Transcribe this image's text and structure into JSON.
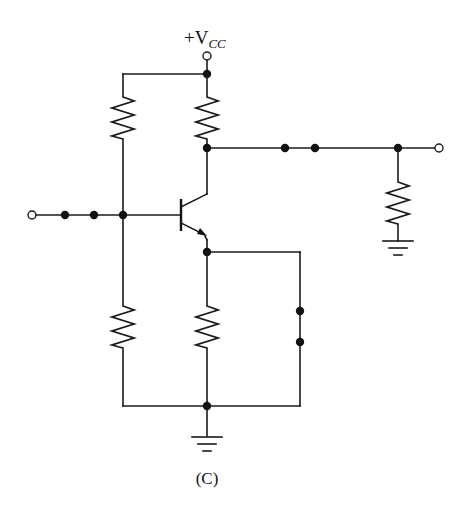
{
  "diagram": {
    "type": "circuit-schematic",
    "figure_label": "(C)",
    "supply_label": {
      "prefix": "+V",
      "subscript": "CC"
    },
    "components": [
      {
        "id": "R1",
        "type": "resistor",
        "role": "upper-bias-resistor",
        "from": "VCC",
        "to": "base-node"
      },
      {
        "id": "R2",
        "type": "resistor",
        "role": "lower-bias-resistor",
        "from": "base-node",
        "to": "ground"
      },
      {
        "id": "RC",
        "type": "resistor",
        "role": "collector-resistor",
        "from": "VCC",
        "to": "collector-node"
      },
      {
        "id": "RE",
        "type": "resistor",
        "role": "emitter-resistor",
        "from": "emitter-node",
        "to": "ground"
      },
      {
        "id": "RL",
        "type": "resistor",
        "role": "load-resistor",
        "from": "output-node",
        "to": "ground"
      },
      {
        "id": "Q1",
        "type": "npn-transistor",
        "base": "base-node",
        "collector": "collector-node",
        "emitter": "emitter-node"
      }
    ],
    "terminals": [
      {
        "id": "input",
        "label": "",
        "position": "left"
      },
      {
        "id": "vcc",
        "label": "+VCC",
        "position": "top"
      },
      {
        "id": "output",
        "label": "",
        "position": "right"
      }
    ],
    "open_connection_points": [
      {
        "id": "input-coupling",
        "between": [
          "input",
          "base-node"
        ],
        "dot_count": 2
      },
      {
        "id": "output-coupling",
        "between": [
          "collector-node",
          "output-node"
        ],
        "dot_count": 2
      },
      {
        "id": "emitter-bypass",
        "between": [
          "emitter-node",
          "ground"
        ],
        "dot_count": 2
      }
    ],
    "grounds": 2
  }
}
